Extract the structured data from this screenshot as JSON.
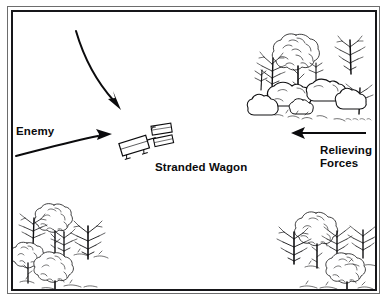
{
  "figure": {
    "kind": "tactical-sketch-map",
    "caption": ""
  },
  "frame": {
    "outer_color": "#6d6d6d",
    "inner_color": "#17171a",
    "background": "#ffffff"
  },
  "labels": {
    "enemy": "Enemy",
    "stranded_wagon": "Stranded Wagon",
    "relieving_line1": "Relieving",
    "relieving_line2": "Forces"
  },
  "arrows": [
    {
      "name": "enemy-approach-arrow-north",
      "style": "curved",
      "direction": "south-east",
      "from": [
        76,
        31
      ],
      "to": [
        119,
        107
      ]
    },
    {
      "name": "enemy-approach-arrow-west",
      "style": "curved",
      "direction": "east",
      "from": [
        16,
        155
      ],
      "to": [
        110,
        136
      ]
    },
    {
      "name": "relieving-forces-arrow",
      "style": "straight",
      "direction": "west",
      "from": [
        366,
        133
      ],
      "to": [
        292,
        133
      ]
    }
  ],
  "terrain": [
    {
      "name": "terrain-cluster-top-right",
      "type": "trees-and-boulders",
      "bounds": [
        256,
        26,
        130,
        104
      ]
    },
    {
      "name": "terrain-cluster-bottom-left",
      "type": "trees",
      "bounds": [
        12,
        196,
        116,
        94
      ]
    },
    {
      "name": "terrain-cluster-bottom-right",
      "type": "trees",
      "bounds": [
        282,
        206,
        104,
        86
      ]
    }
  ],
  "symbols": [
    {
      "name": "stranded-wagon-symbol",
      "type": "wagon-with-team",
      "bounds": [
        120,
        128,
        58,
        32
      ],
      "rotation_deg": -18
    }
  ],
  "colors": {
    "ink": "#0b0b0d",
    "paper": "#ffffff",
    "frame_light": "#6d6d6d"
  }
}
